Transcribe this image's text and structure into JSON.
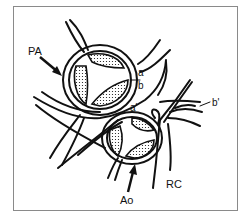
{
  "diagram": {
    "kind": "anatomical line drawing",
    "labels": {
      "pa": "PA",
      "ao": "Ao",
      "rc": "RC",
      "a": "a",
      "b": "b",
      "a_prime": "a'",
      "b_prime": "b'"
    },
    "structures": [
      {
        "id": "pulmonary-valve",
        "label_ref": "pa",
        "shape": "tricuspid valve, three stippled cusps in double ring"
      },
      {
        "id": "aortic-valve",
        "label_ref": "ao",
        "shape": "tricuspid valve, three stippled cusps in double ring"
      },
      {
        "id": "right-coronary",
        "label_ref": "rc",
        "shape": "branching vessel lines"
      }
    ],
    "colors": {
      "ink": "#111111",
      "frame": "#8a8a8a",
      "background": "#ffffff"
    }
  }
}
